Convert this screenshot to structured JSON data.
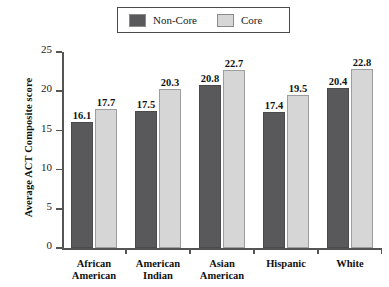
{
  "chart_data": {
    "type": "bar",
    "title": "",
    "xlabel": "",
    "ylabel": "Average ACT Composite score",
    "ylim": [
      0,
      25
    ],
    "ytick_labels": [
      "0",
      "5",
      "10",
      "15",
      "20",
      "25"
    ],
    "yticks": [
      0,
      5,
      10,
      15,
      20,
      25
    ],
    "grid": false,
    "legend_position": "top-center",
    "categories": [
      "African American",
      "American Indian",
      "Asian American",
      "Hispanic",
      "White"
    ],
    "category_lines": [
      [
        "African",
        "American"
      ],
      [
        "American",
        "Indian"
      ],
      [
        "Asian",
        "American"
      ],
      [
        "Hispanic",
        ""
      ],
      [
        "White",
        ""
      ]
    ],
    "series": [
      {
        "name": "Non-Core",
        "color": "#59595b",
        "values": [
          16.1,
          17.5,
          20.8,
          17.4,
          20.4
        ],
        "labels": [
          "16.1",
          "17.5",
          "20.8",
          "17.4",
          "20.4"
        ]
      },
      {
        "name": "Core",
        "color": "#d6d6d6",
        "values": [
          17.7,
          20.3,
          22.7,
          19.5,
          22.8
        ],
        "labels": [
          "17.7",
          "20.3",
          "22.7",
          "19.5",
          "22.8"
        ]
      }
    ]
  },
  "legend": {
    "entries": [
      {
        "label": "Non-Core",
        "swatch": "dark-gray-swatch-icon"
      },
      {
        "label": "Core",
        "swatch": "light-gray-swatch-icon"
      }
    ]
  },
  "axes": {
    "y_title": "Average ACT Composite score",
    "y_tick_labels": [
      "25",
      "20",
      "15",
      "10",
      "5",
      "0"
    ]
  }
}
